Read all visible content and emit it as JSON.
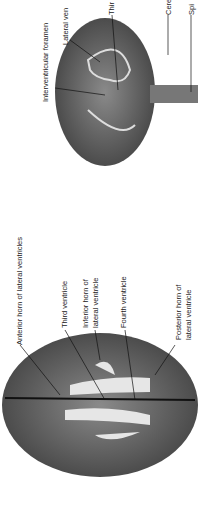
{
  "figure": {
    "orientation": "rotated-90-ccw",
    "panels": [
      {
        "id": "lateral-view",
        "labels": [
          {
            "text": "Interventricular foramen"
          },
          {
            "text": "Lateral ventricle"
          },
          {
            "text": "Third ventricle"
          },
          {
            "text": "Cerebral aqueduct"
          },
          {
            "text": "Spinal cord"
          }
        ]
      },
      {
        "id": "superior-view",
        "labels": [
          {
            "text": "Anterior horn of lateral ventricles"
          },
          {
            "text": "Third ventricle"
          },
          {
            "text": "Inferior horn of lateral ventricle"
          },
          {
            "text": "Fourth ventricle"
          },
          {
            "text": "Posterior horn of lateral ventricle"
          }
        ]
      }
    ],
    "visible_label_text": {
      "interventricular": "Interventricular foramen",
      "lateral": "Lateral ven",
      "third_top": "Thir",
      "cere": "Cere",
      "spi": "Spi",
      "anterior": "Anterior horn of lateral ventricles",
      "third": "Third ventricle",
      "inferior_1": "Inferior horn of",
      "inferior_2": "lateral ventricle",
      "fourth": "Fourth ventricle",
      "posterior_1": "Posterior horn of",
      "posterior_2": "lateral ventricle"
    },
    "colors": {
      "brain_dark": "#4a4a4a",
      "brain_mid": "#7a7a7a",
      "ventricle": "#e6e6e6",
      "line": "#111111"
    }
  }
}
